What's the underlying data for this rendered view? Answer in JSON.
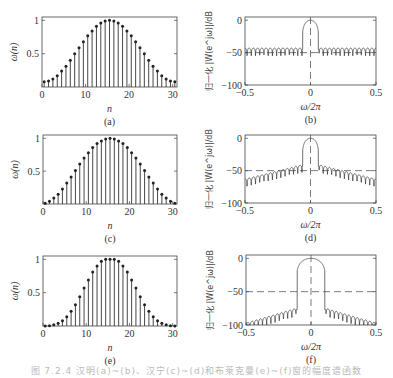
{
  "figure": {
    "caption": "图 7.2.4  汉明(a)~(b)、汉宁(c)~(d)和布莱克曼(e)~(f)窗的幅度谱函数",
    "dashed_level_db": -50
  },
  "chart_data": [
    {
      "id": "a",
      "type": "stem",
      "label": "(a)",
      "xlabel": "n",
      "ylabel": "ω(n)",
      "xlim": [
        0,
        31
      ],
      "ylim": [
        0,
        1.05
      ],
      "xticks": [
        0,
        10,
        20,
        30
      ],
      "yticks": [
        0.5,
        1
      ],
      "ytick_labels": [
        "0.5",
        "1"
      ],
      "window": "hamming",
      "N": 31,
      "x": [
        1,
        2,
        3,
        4,
        5,
        6,
        7,
        8,
        9,
        10,
        11,
        12,
        13,
        14,
        15,
        16,
        17,
        18,
        19,
        20,
        21,
        22,
        23,
        24,
        25,
        26,
        27,
        28,
        29,
        30,
        31
      ],
      "values": [
        0.08,
        0.09,
        0.12,
        0.17,
        0.24,
        0.31,
        0.4,
        0.5,
        0.59,
        0.68,
        0.77,
        0.84,
        0.91,
        0.96,
        0.99,
        1.0,
        0.99,
        0.96,
        0.91,
        0.84,
        0.77,
        0.68,
        0.59,
        0.5,
        0.4,
        0.31,
        0.24,
        0.17,
        0.12,
        0.09,
        0.08
      ]
    },
    {
      "id": "b",
      "type": "line",
      "label": "(b)",
      "xlabel": "ω/2π",
      "ylabel": "归一化 |W(e^jω)|/dB",
      "xlim": [
        -0.5,
        0.5
      ],
      "ylim": [
        -100,
        5
      ],
      "xticks": [
        -0.5,
        0,
        0.5
      ],
      "yticks": [
        0,
        -50,
        -100
      ],
      "mainlobe_halfwidth": 0.065,
      "sidelobe_peak_db": -43,
      "sidelobe_decay_db": 0,
      "dashed_hline": -50,
      "dashed_vline": 0
    },
    {
      "id": "c",
      "type": "stem",
      "label": "(c)",
      "xlabel": "n",
      "ylabel": "ω(n)",
      "xlim": [
        0,
        31
      ],
      "ylim": [
        0,
        1.05
      ],
      "xticks": [
        0,
        10,
        20,
        30
      ],
      "yticks": [
        0.5,
        1
      ],
      "ytick_labels": [
        "0.5",
        "1"
      ],
      "window": "hanning",
      "N": 31,
      "x": [
        1,
        2,
        3,
        4,
        5,
        6,
        7,
        8,
        9,
        10,
        11,
        12,
        13,
        14,
        15,
        16,
        17,
        18,
        19,
        20,
        21,
        22,
        23,
        24,
        25,
        26,
        27,
        28,
        29,
        30,
        31
      ],
      "values": [
        0.01,
        0.04,
        0.09,
        0.15,
        0.23,
        0.32,
        0.41,
        0.51,
        0.61,
        0.7,
        0.78,
        0.86,
        0.92,
        0.96,
        0.99,
        1.0,
        0.99,
        0.96,
        0.92,
        0.86,
        0.78,
        0.7,
        0.61,
        0.51,
        0.41,
        0.32,
        0.23,
        0.15,
        0.09,
        0.04,
        0.01
      ]
    },
    {
      "id": "d",
      "type": "line",
      "label": "(d)",
      "xlabel": "ω/2π",
      "ylabel": "归一化 |W(e^jω)|/dB",
      "xlim": [
        -0.5,
        0.5
      ],
      "ylim": [
        -100,
        5
      ],
      "xticks": [
        -0.5,
        0,
        0.5
      ],
      "yticks": [
        0,
        -50,
        -100
      ],
      "mainlobe_halfwidth": 0.065,
      "sidelobe_peak_db": -41,
      "sidelobe_decay_db": 22,
      "dashed_hline": -50,
      "dashed_vline": 0
    },
    {
      "id": "e",
      "type": "stem",
      "label": "(e)",
      "xlabel": "n",
      "ylabel": "ω(n)",
      "xlim": [
        0,
        31
      ],
      "ylim": [
        0,
        1.05
      ],
      "xticks": [
        0,
        10,
        20,
        30
      ],
      "yticks": [
        0.5,
        1
      ],
      "ytick_labels": [
        "0.5",
        "1"
      ],
      "window": "blackman",
      "N": 31,
      "x": [
        1,
        2,
        3,
        4,
        5,
        6,
        7,
        8,
        9,
        10,
        11,
        12,
        13,
        14,
        15,
        16,
        17,
        18,
        19,
        20,
        21,
        22,
        23,
        24,
        25,
        26,
        27,
        28,
        29,
        30,
        31
      ],
      "values": [
        0.0,
        0.004,
        0.02,
        0.04,
        0.08,
        0.14,
        0.22,
        0.32,
        0.44,
        0.57,
        0.69,
        0.81,
        0.9,
        0.97,
        1.0,
        1.0,
        1.0,
        0.97,
        0.9,
        0.81,
        0.69,
        0.57,
        0.44,
        0.32,
        0.22,
        0.14,
        0.08,
        0.04,
        0.02,
        0.004,
        0.0
      ]
    },
    {
      "id": "f",
      "type": "line",
      "label": "(f)",
      "xlabel": "ω/2π",
      "ylabel": "归一化 |W(e^jω)|/dB",
      "xlim": [
        -0.5,
        0.5
      ],
      "ylim": [
        -100,
        5
      ],
      "xticks": [
        -0.5,
        0,
        0.5
      ],
      "yticks": [
        0,
        -50,
        -100
      ],
      "mainlobe_halfwidth": 0.115,
      "sidelobe_peak_db": -75,
      "sidelobe_decay_db": 22,
      "dashed_hline": -50,
      "dashed_vline": 0
    }
  ]
}
